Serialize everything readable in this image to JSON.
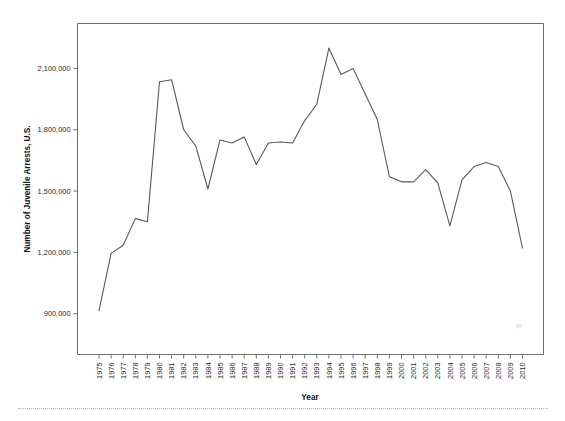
{
  "figure": {
    "background_color": "#ffffff",
    "frame_color": "#6f6f6f",
    "line_color": "#595959",
    "bottom_rule_color": "#b9b9b9"
  },
  "chart_data": {
    "type": "line",
    "title": "",
    "xlabel": "Year",
    "ylabel": "Number of Juvenile Arrests, U.S.",
    "grid": false,
    "legend": false,
    "legend_position": "none",
    "xlim": [
      1975,
      2010
    ],
    "ylim": [
      700000,
      2320000
    ],
    "ytick_labels": [
      "900,000",
      "1,200,000",
      "1,500,000",
      "1,800,000",
      "2,100,000"
    ],
    "ytick_values": [
      900000,
      1200000,
      1500000,
      1800000,
      2100000
    ],
    "xtick_labels": [
      "1975",
      "1976",
      "1977",
      "1978",
      "1979",
      "1980",
      "1981",
      "1982",
      "1983",
      "1984",
      "1985",
      "1986",
      "1987",
      "1988",
      "1989",
      "1990",
      "1991",
      "1992",
      "1993",
      "1994",
      "1995",
      "1996",
      "1997",
      "1998",
      "1999",
      "2000",
      "2001",
      "2002",
      "2003",
      "2004",
      "2005",
      "2006",
      "2007",
      "2008",
      "2009",
      "2010"
    ],
    "categories": [
      1975,
      1976,
      1977,
      1978,
      1979,
      1980,
      1981,
      1982,
      1983,
      1984,
      1985,
      1986,
      1987,
      1988,
      1989,
      1990,
      1991,
      1992,
      1993,
      1994,
      1995,
      1996,
      1997,
      1998,
      1999,
      2000,
      2001,
      2002,
      2003,
      2004,
      2005,
      2006,
      2007,
      2008,
      2009,
      2010
    ],
    "values": [
      915000,
      1195000,
      1235000,
      1365000,
      1350000,
      2035000,
      2045000,
      1800000,
      1720000,
      1510000,
      1750000,
      1735000,
      1765000,
      1630000,
      1735000,
      1740000,
      1735000,
      1845000,
      1925000,
      2200000,
      2070000,
      2100000,
      1975000,
      1850000,
      1570000,
      1545000,
      1545000,
      1605000,
      1540000,
      1330000,
      1555000,
      1620000,
      1640000,
      1620000,
      1500000,
      1220000
    ],
    "series": [
      {
        "name": "Number of Juvenile Arrests, U.S.",
        "values": [
          915000,
          1195000,
          1235000,
          1365000,
          1350000,
          2035000,
          2045000,
          1800000,
          1720000,
          1510000,
          1750000,
          1735000,
          1765000,
          1630000,
          1735000,
          1740000,
          1735000,
          1845000,
          1925000,
          2200000,
          2070000,
          2100000,
          1975000,
          1850000,
          1570000,
          1545000,
          1545000,
          1605000,
          1540000,
          1330000,
          1555000,
          1620000,
          1640000,
          1620000,
          1500000,
          1220000
        ]
      }
    ],
    "annotations": []
  }
}
